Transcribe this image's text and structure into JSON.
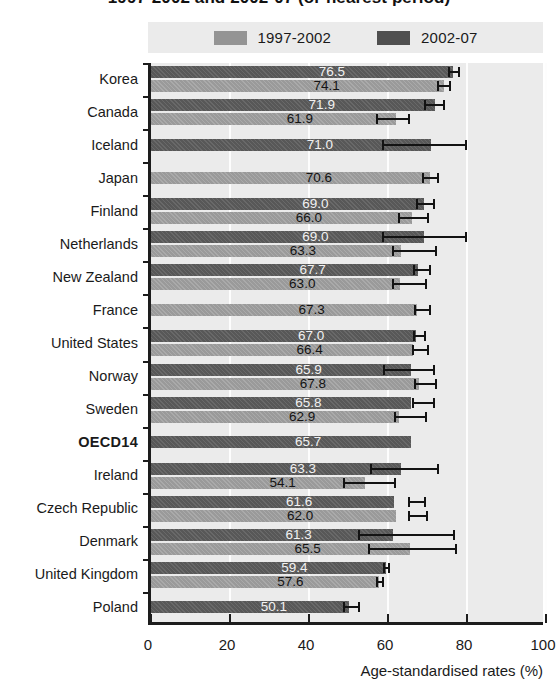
{
  "title": "1997-2002 and 2002-07 (or nearest period)",
  "legend": {
    "position": "top",
    "items": [
      {
        "label": "1997-2002",
        "color": "#949494",
        "key": "p1"
      },
      {
        "label": "2002-07",
        "color": "#4f4f4f",
        "key": "p2"
      }
    ]
  },
  "axis": {
    "xlabel": "Age-standardised rates (%)",
    "ticks": [
      "0",
      "20",
      "40",
      "60",
      "80",
      "100"
    ],
    "xlim": [
      0,
      100
    ]
  },
  "chart_data": {
    "type": "bar",
    "orientation": "horizontal",
    "title": "1997-2002 and 2002-07 (or nearest period)",
    "xlabel": "Age-standardised rates (%)",
    "ylabel": "",
    "xlim": [
      0,
      100
    ],
    "grid": true,
    "legend_position": "top",
    "categories": [
      "Korea",
      "Canada",
      "Iceland",
      "Japan",
      "Finland",
      "Netherlands",
      "New Zealand",
      "France",
      "United States",
      "Norway",
      "Sweden",
      "OECD14",
      "Ireland",
      "Czech Republic",
      "Denmark",
      "United Kingdom",
      "Poland"
    ],
    "series": [
      {
        "name": "2002-07",
        "color": "#4f4f4f",
        "values": [
          76.5,
          71.9,
          71.0,
          null,
          69.0,
          69.0,
          67.7,
          null,
          67.0,
          65.9,
          65.8,
          65.7,
          63.3,
          61.6,
          61.3,
          59.4,
          50.1
        ],
        "ci_low": [
          75.1,
          69.0,
          58.5,
          null,
          67.0,
          58.5,
          66.3,
          null,
          66.4,
          58.8,
          66.0,
          null,
          55.5,
          65.0,
          52.5,
          58.8,
          48.5
        ],
        "ci_high": [
          78.2,
          74.5,
          80.0,
          null,
          72.0,
          80.0,
          71.0,
          null,
          69.5,
          72.0,
          72.0,
          null,
          73.0,
          69.5,
          77.0,
          60.5,
          53.0
        ]
      },
      {
        "name": "1997-2002",
        "color": "#949494",
        "values": [
          74.1,
          61.9,
          null,
          70.6,
          66.0,
          63.3,
          63.0,
          67.3,
          66.4,
          67.8,
          62.9,
          null,
          54.1,
          62.0,
          65.5,
          57.6,
          null
        ],
        "ci_low": [
          72.5,
          57.0,
          null,
          68.5,
          62.5,
          61.0,
          61.0,
          66.5,
          66.0,
          66.5,
          61.5,
          null,
          48.5,
          65.0,
          55.0,
          57.0,
          null
        ],
        "ci_high": [
          76.0,
          65.5,
          null,
          73.0,
          70.5,
          72.5,
          70.0,
          71.0,
          70.5,
          72.5,
          70.0,
          null,
          62.0,
          70.0,
          77.5,
          59.0,
          null
        ]
      }
    ],
    "emphasised_category": "OECD14"
  }
}
